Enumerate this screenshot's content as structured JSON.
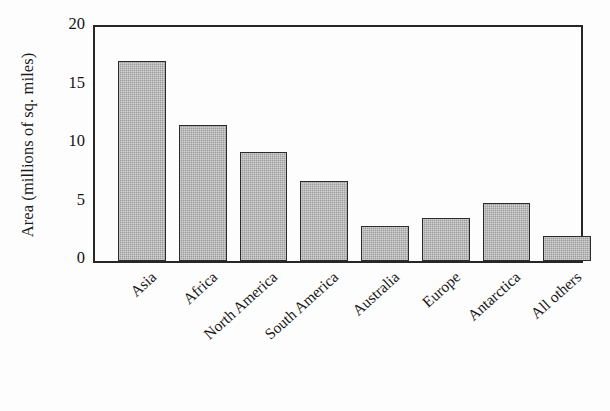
{
  "chart_data": {
    "type": "bar",
    "title": "",
    "xlabel": "",
    "ylabel": "Area (millions of sq. miles)",
    "categories": [
      "Asia",
      "Africa",
      "North America",
      "South America",
      "Australia",
      "Europe",
      "Antarctica",
      "All others"
    ],
    "values": [
      17.1,
      11.6,
      9.3,
      6.8,
      3.0,
      3.7,
      5.0,
      2.1
    ],
    "ylim": [
      0,
      20
    ],
    "yticks": [
      0,
      5,
      10,
      15,
      20
    ],
    "ytick_labels": [
      "0",
      "5",
      "10",
      "15",
      "20"
    ],
    "grid": false,
    "legend": null,
    "bar_color": "#9d9d9d",
    "bar_edge_color": "#2b2b2b",
    "frame_color": "#272727",
    "background": "#fdfdfd"
  }
}
